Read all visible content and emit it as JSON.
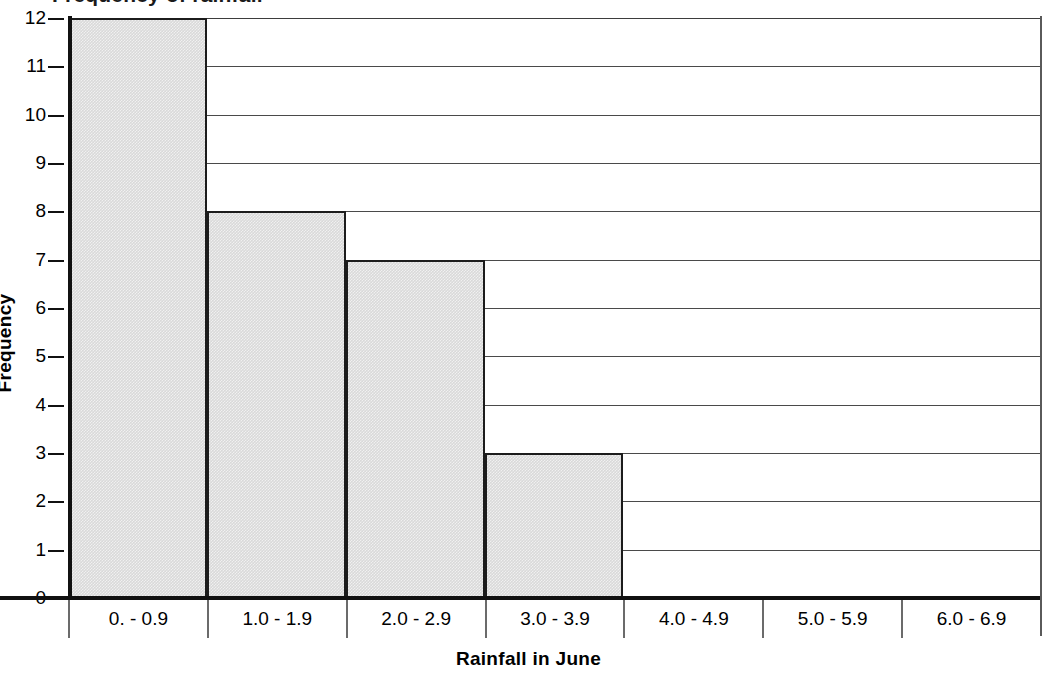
{
  "chart_data": {
    "type": "bar",
    "title": "Frequency of rainfall",
    "title_visible_fragment": "requency",
    "title_cropped": true,
    "xlabel": "Rainfall in June",
    "ylabel": "Frequency",
    "categories": [
      "0. - 0.9",
      "1.0 - 1.9",
      "2.0 - 2.9",
      "3.0 - 3.9",
      "4.0 - 4.9",
      "5.0 - 5.9",
      "6.0 - 6.9"
    ],
    "values": [
      12,
      8,
      7,
      3,
      0,
      0,
      0
    ],
    "ylim": [
      0,
      12
    ],
    "yticks": [
      0,
      1,
      2,
      3,
      4,
      5,
      6,
      7,
      8,
      9,
      10,
      11,
      12
    ],
    "ytick_labels": [
      "0",
      "1",
      "2",
      "3",
      "4",
      "5",
      "6",
      "7",
      "8",
      "9",
      "10",
      "11",
      "12"
    ],
    "grid": true,
    "grid_axis": "y",
    "legend": false,
    "bar_fill_color": "#d9d9d9",
    "bar_edge_color": "#1c1c1c",
    "gridline_color": "#4a4a4a",
    "axis_color": "#111111",
    "background_color": "#ffffff"
  }
}
